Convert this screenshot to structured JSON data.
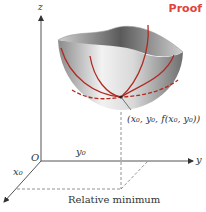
{
  "header": {
    "badge": "Proof"
  },
  "diagram": {
    "title": "Relative minimum",
    "point_label": "(x₀, y₀, f(x₀, y₀))",
    "axes": {
      "x": "x",
      "y": "y",
      "z": "z",
      "origin": "O"
    },
    "ticks": {
      "x0": "x₀",
      "y0": "y₀"
    },
    "caption": "Relative minimum"
  },
  "colors": {
    "accent": "#e0433a",
    "curve": "#b02a22",
    "axis": "#555555"
  }
}
